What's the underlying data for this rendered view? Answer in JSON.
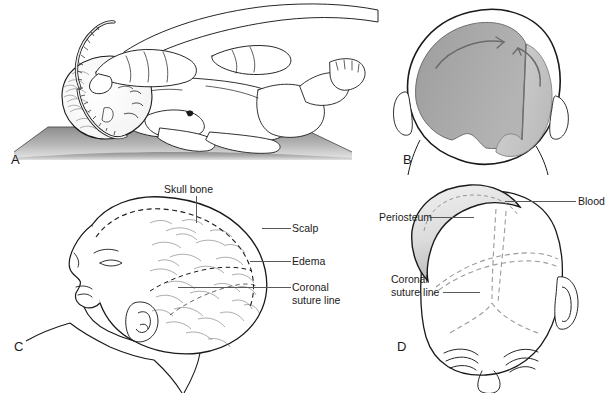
{
  "figure": {
    "background_color": "#ffffff",
    "line_color": "#1a1a1a",
    "leader_color": "#58595b"
  },
  "panels": [
    {
      "letter": "A",
      "name": "head-circumference-measurement",
      "description": "Infant lying supine on a padded surface while a hand holds a flexible measuring tape around the head"
    },
    {
      "letter": "B",
      "name": "molding-bone-overlap",
      "description": "Posterior view of newborn head showing overlapping shaded parietal bones with curved arrows indicating molding direction"
    },
    {
      "letter": "C",
      "name": "caput-succedaneum-profile",
      "description": "Side profile of newborn head showing edema crossing the suture line"
    },
    {
      "letter": "D",
      "name": "cephalohematoma-top-view",
      "description": "Top view of newborn head showing blood collection beneath the periosteum bounded by suture lines"
    }
  ],
  "labels": {
    "skull_bone": "Skull bone",
    "scalp": "Scalp",
    "edema": "Edema",
    "coronal_suture_line_c": "Coronal\nsuture line",
    "blood": "Blood",
    "periosteum": "Periosteum",
    "coronal_suture_line_d": "Coronal\nsuture line"
  },
  "colors": {
    "mattress_light": "#d8d8d8",
    "mattress_dark": "#8e8e8e",
    "bone_left": "#a9a9a9",
    "bone_right": "#c7c7c7",
    "hematoma_fill": "#d5d5d5",
    "outline": "#1a1a1a"
  }
}
